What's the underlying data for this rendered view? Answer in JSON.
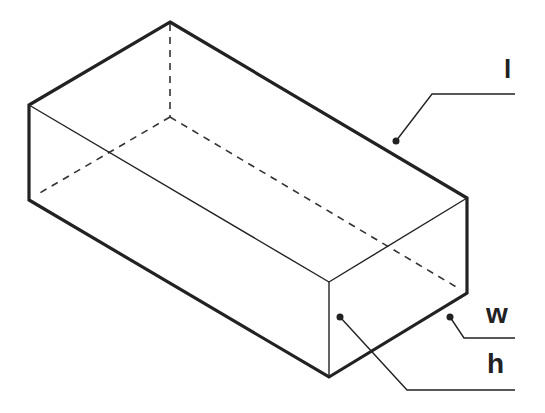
{
  "diagram": {
    "type": "rectangular-prism",
    "colors": {
      "stroke": "#222222",
      "background": "#ffffff"
    },
    "labels": {
      "length": "l",
      "width": "w",
      "height": "h"
    },
    "vertices": {
      "top_back": [
        170,
        22
      ],
      "left_top": [
        29,
        105
      ],
      "left_bottom": [
        29,
        200
      ],
      "right_top": [
        467,
        198
      ],
      "right_bottom": [
        467,
        293
      ],
      "front_top": [
        329,
        282
      ],
      "front_bottom": [
        329,
        377
      ],
      "hidden": [
        170,
        117
      ]
    }
  }
}
